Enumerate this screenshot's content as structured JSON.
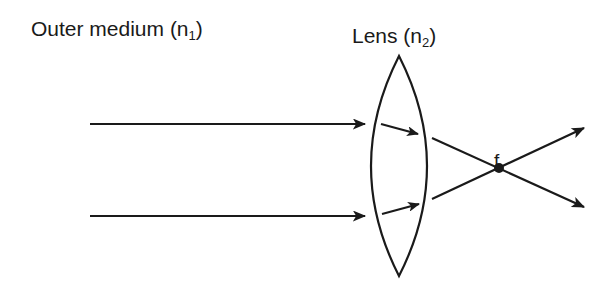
{
  "labels": {
    "outer_medium": "Outer medium (n",
    "outer_medium_sub": "1",
    "outer_medium_close": ")",
    "lens": "Lens (n",
    "lens_sub": "2",
    "lens_close": ")",
    "focal_point": "f"
  },
  "colors": {
    "stroke": "#1a1a1a",
    "background": "#ffffff"
  },
  "diagram": {
    "type": "converging lens ray diagram",
    "incident_rays": 2,
    "refracted_rays_inside_lens": 2,
    "exit_rays": 2,
    "focal_point_label": "f"
  }
}
